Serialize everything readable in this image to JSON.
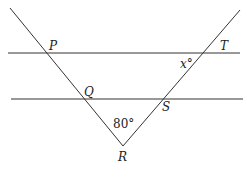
{
  "diagram": {
    "labels": {
      "P": "P",
      "T": "T",
      "Q": "Q",
      "S": "S",
      "R": "R"
    },
    "angle_x": "x°",
    "angle_R": "80°"
  },
  "colors": {
    "line": "#333333",
    "text": "#222222"
  }
}
